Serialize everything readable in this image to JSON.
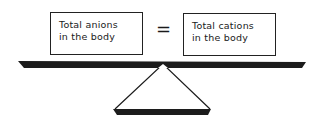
{
  "diagram": {
    "left_box": {
      "line1": "Total anions",
      "line2": "in the body"
    },
    "operator": "=",
    "right_box": {
      "line1": "Total cations",
      "line2": "in the body"
    },
    "balance": {
      "beam_color": "#1c1c1c",
      "fulcrum_color": "#1c1c1c"
    }
  }
}
